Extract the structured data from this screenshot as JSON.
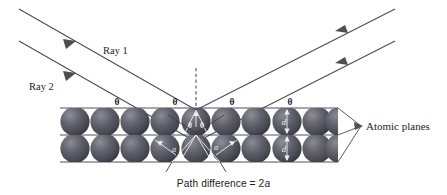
{
  "figure": {
    "background_color": "#ffffff",
    "ray_color": "#4e4e56",
    "sphere_color_dark": "#45454d",
    "sphere_color_light": "#8a8a93",
    "plane_line_color": "#3d3d45",
    "white_geometry_color": "#efeff1",
    "text_color": "#23232a"
  },
  "rays": {
    "incident": [
      {
        "id": "ray-1",
        "label": "Ray 1"
      },
      {
        "id": "ray-2",
        "label": "Ray 2"
      }
    ],
    "label_1": "Ray 1",
    "label_2": "Ray 2"
  },
  "angles": {
    "symbol": "θ",
    "top_surface": [
      "θ",
      "θ",
      "θ",
      "θ"
    ],
    "interior": [
      "θ",
      "θ"
    ],
    "lower_interior": [
      "θ",
      "θ"
    ]
  },
  "annotations": {
    "atomic_planes_label": "Atomic planes",
    "spacing_label": "d",
    "path_segment_label": "a",
    "caption_prefix": "Path difference = 2",
    "caption_variable": "a",
    "caption_full": "Path difference = 2a"
  },
  "lattice": {
    "rows": 2,
    "spheres_per_row": 9,
    "row_top_y": 108,
    "row_mid_y": 135,
    "row_bottom_y": 162,
    "left_x": 60,
    "right_x": 338
  }
}
